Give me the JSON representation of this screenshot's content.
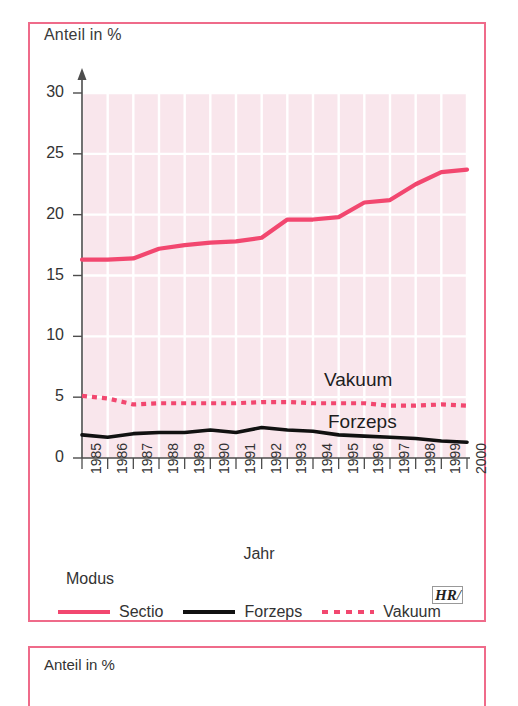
{
  "panel": {
    "y_axis_title": "Anteil in %",
    "x_axis_title": "Jahr",
    "legend_title": "Modus",
    "watermark": "HR"
  },
  "panel_below": {
    "y_axis_title": "Anteil in %"
  },
  "annotations": {
    "vakuum": "Vakuum",
    "forzeps": "Forzeps"
  },
  "legend": [
    {
      "label": "Sectio",
      "style": "solid-red",
      "color": "#f2476f"
    },
    {
      "label": "Forzeps",
      "style": "solid-black",
      "color": "#111111"
    },
    {
      "label": "Vakuum",
      "style": "dotted-red",
      "color": "#f2476f"
    }
  ],
  "colors": {
    "frame": "#ef6b8a",
    "plot_background": "#f9e6ec",
    "grid": "#ffffff",
    "axis": "#4d4d4d",
    "sectio": "#f2476f",
    "forzeps": "#111111",
    "vakuum": "#f2476f"
  },
  "chart_data": {
    "type": "line",
    "title": "",
    "xlabel": "Jahr",
    "ylabel": "Anteil in %",
    "ylim": [
      0,
      30
    ],
    "yticks": [
      0,
      5,
      10,
      15,
      20,
      25,
      30
    ],
    "grid": true,
    "legend_position": "bottom",
    "categories": [
      "1985",
      "1986",
      "1987",
      "1988",
      "1989",
      "1990",
      "1991",
      "1992",
      "1993",
      "1994",
      "1995",
      "1996",
      "1997",
      "1998",
      "1999",
      "2000"
    ],
    "series": [
      {
        "name": "Sectio",
        "style": "solid",
        "color": "#f2476f",
        "values": [
          16.3,
          16.3,
          16.4,
          17.2,
          17.5,
          17.7,
          17.8,
          18.1,
          19.6,
          19.6,
          19.8,
          21.0,
          21.2,
          22.5,
          23.5,
          23.7
        ]
      },
      {
        "name": "Forzeps",
        "style": "solid",
        "color": "#111111",
        "values": [
          1.9,
          1.7,
          2.0,
          2.1,
          2.1,
          2.3,
          2.1,
          2.5,
          2.3,
          2.2,
          1.9,
          1.8,
          1.7,
          1.6,
          1.4,
          1.3
        ]
      },
      {
        "name": "Vakuum",
        "style": "dotted",
        "color": "#f2476f",
        "values": [
          5.1,
          4.9,
          4.4,
          4.5,
          4.5,
          4.5,
          4.5,
          4.6,
          4.6,
          4.5,
          4.5,
          4.5,
          4.3,
          4.3,
          4.4,
          4.3
        ]
      }
    ]
  }
}
